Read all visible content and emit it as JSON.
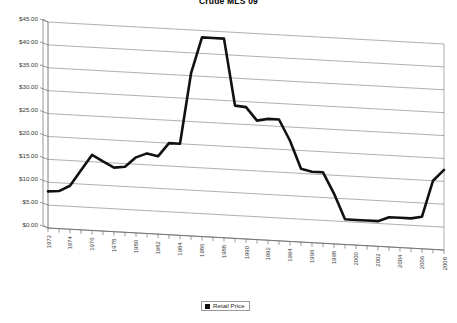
{
  "chart": {
    "title": "Crude MLS 09",
    "legend": {
      "label": "Retail Price",
      "swatch_color": "#111111",
      "position": "bottom-center"
    },
    "colors": {
      "series_line": "#111111",
      "gridline": "#8c8c8c",
      "axis": "#6e6e6e",
      "tick_text": "#3a3a3a",
      "background": "#ffffff"
    }
  },
  "chart_data": {
    "type": "line",
    "title": "Crude MLS 09",
    "xlabel": "",
    "ylabel": "",
    "ylim": [
      0,
      45
    ],
    "grid": true,
    "legend_position": "bottom-center",
    "y_tick_labels": [
      "$0.00",
      "$5.00",
      "$10.00",
      "$15.00",
      "$20.00",
      "$25.00",
      "$30.00",
      "$35.00",
      "$40.00",
      "$45.00"
    ],
    "y_tick_values": [
      0,
      5,
      10,
      15,
      20,
      25,
      30,
      35,
      40,
      45
    ],
    "x_tick_labels": [
      "1972",
      "1974",
      "1976",
      "1978",
      "1980",
      "1982",
      "1984",
      "1986",
      "1988",
      "1990",
      "1992",
      "1994",
      "1996",
      "1998",
      "2000",
      "2002",
      "2004",
      "2006",
      "2008"
    ],
    "categories": [
      1972,
      1973,
      1974,
      1975,
      1976,
      1977,
      1978,
      1979,
      1980,
      1981,
      1982,
      1983,
      1984,
      1985,
      1986,
      1987,
      1988,
      1989,
      1990,
      1991,
      1992,
      1993,
      1994,
      1995,
      1996,
      1997,
      1998,
      1999,
      2000,
      2001,
      2002,
      2003,
      2004,
      2005,
      2006,
      2007,
      2008
    ],
    "series": [
      {
        "name": "Retail Price",
        "values": [
          8.0,
          8.2,
          9.5,
          13.0,
          16.5,
          15.2,
          14.0,
          14.3,
          16.5,
          17.5,
          17.0,
          20.0,
          20.0,
          35.5,
          43.5,
          43.5,
          43.5,
          29.0,
          28.8,
          26.0,
          26.5,
          26.5,
          22.0,
          16.0,
          15.5,
          15.5,
          11.0,
          5.5,
          5.5,
          5.5,
          5.5,
          6.5,
          6.5,
          6.5,
          7.0,
          15.0,
          17.5
        ]
      }
    ]
  }
}
